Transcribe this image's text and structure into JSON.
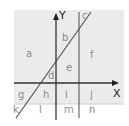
{
  "diagram": {
    "axes": {
      "x_label": "X",
      "y_label": "Y"
    },
    "regions": {
      "a": "a",
      "b": "b",
      "c": "c",
      "d": "d",
      "e": "e",
      "f": "f",
      "g": "g",
      "h": "h",
      "i": "i",
      "j": "j",
      "k": "k",
      "l": "l",
      "m": "m",
      "n": "n"
    },
    "colors": {
      "shaded_region": "#ebebeb",
      "background": "#ffffff",
      "axis": "#333333",
      "lines": "#555555",
      "grid_line": "#cfcfcf",
      "label": "#8a8a8a"
    }
  }
}
